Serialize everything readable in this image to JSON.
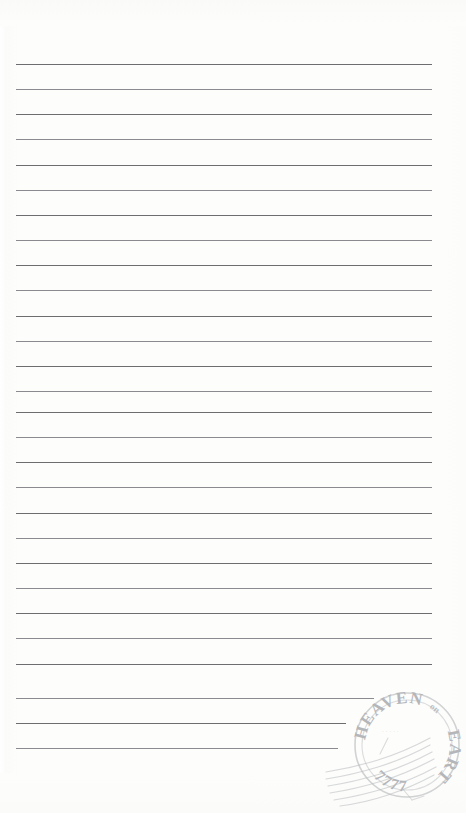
{
  "document": {
    "type": "lined-writing-paper",
    "title": "Blank ruled letter sheet with postmark",
    "width": 466,
    "height": 813,
    "background_color": "#fdfdfc",
    "body_text": ""
  },
  "ruling": {
    "line_color": "#5f6163",
    "line_thickness_px": 1,
    "line_spacing_px": 25.2,
    "first_line_y": 64,
    "left_margin_x": 16,
    "right_margin_x": 432,
    "line_count": 28,
    "lines": [
      {
        "index": 1,
        "y": 64,
        "x": 16,
        "width": 416
      },
      {
        "index": 2,
        "y": 89,
        "x": 16,
        "width": 416
      },
      {
        "index": 3,
        "y": 114,
        "x": 16,
        "width": 416
      },
      {
        "index": 4,
        "y": 139,
        "x": 16,
        "width": 416
      },
      {
        "index": 5,
        "y": 165,
        "x": 16,
        "width": 416
      },
      {
        "index": 6,
        "y": 190,
        "x": 16,
        "width": 416
      },
      {
        "index": 7,
        "y": 215,
        "x": 16,
        "width": 416
      },
      {
        "index": 8,
        "y": 240,
        "x": 16,
        "width": 416
      },
      {
        "index": 9,
        "y": 265,
        "x": 16,
        "width": 416
      },
      {
        "index": 10,
        "y": 290,
        "x": 16,
        "width": 416
      },
      {
        "index": 11,
        "y": 316,
        "x": 16,
        "width": 416
      },
      {
        "index": 12,
        "y": 341,
        "x": 16,
        "width": 416
      },
      {
        "index": 13,
        "y": 366,
        "x": 16,
        "width": 416
      },
      {
        "index": 14,
        "y": 391,
        "x": 16,
        "width": 416
      },
      {
        "index": 15,
        "y": 412,
        "x": 16,
        "width": 416
      },
      {
        "index": 16,
        "y": 437,
        "x": 16,
        "width": 416
      },
      {
        "index": 17,
        "y": 462,
        "x": 16,
        "width": 416
      },
      {
        "index": 18,
        "y": 487,
        "x": 16,
        "width": 416
      },
      {
        "index": 19,
        "y": 513,
        "x": 16,
        "width": 416
      },
      {
        "index": 20,
        "y": 538,
        "x": 16,
        "width": 416
      },
      {
        "index": 21,
        "y": 563,
        "x": 16,
        "width": 416
      },
      {
        "index": 22,
        "y": 588,
        "x": 16,
        "width": 416
      },
      {
        "index": 23,
        "y": 613,
        "x": 16,
        "width": 416
      },
      {
        "index": 24,
        "y": 638,
        "x": 16,
        "width": 416
      },
      {
        "index": 25,
        "y": 664,
        "x": 16,
        "width": 416
      },
      {
        "index": 26,
        "y": 698,
        "x": 16,
        "width": 358
      },
      {
        "index": 27,
        "y": 723,
        "x": 16,
        "width": 330
      },
      {
        "index": 28,
        "y": 748,
        "x": 16,
        "width": 322
      }
    ]
  },
  "postmark": {
    "name": "circular-date-stamp",
    "ink_color": "#b9bbbd",
    "center_x": 407,
    "center_y": 745,
    "outer_radius": 52,
    "inner_radius": 45,
    "top_arc_text": "HEAVEN",
    "separator_text": "on",
    "right_arc_text": "EARTH",
    "bottom_arc_text": "7777",
    "center_text": "",
    "cancellation_waves": 6
  }
}
